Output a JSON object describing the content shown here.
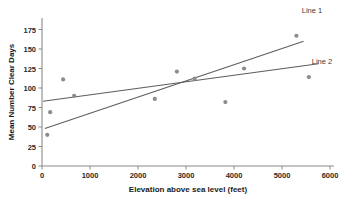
{
  "chart_data": {
    "type": "scatter",
    "title": "",
    "xlabel": "Elevation above sea level (feet)",
    "ylabel": "Mean Number Clear Days",
    "xlim": [
      0,
      6000
    ],
    "ylim": [
      0,
      190
    ],
    "xticks": [
      0,
      1000,
      2000,
      3000,
      4000,
      5000,
      6000
    ],
    "xtick_labels": [
      "0",
      "1000",
      "2000",
      "3000",
      "4000",
      "5000",
      "6000"
    ],
    "yticks": [
      0,
      25,
      50,
      75,
      100,
      125,
      150,
      175
    ],
    "ytick_labels": [
      "0",
      "25",
      "50",
      "75",
      "100",
      "125",
      "150",
      "175"
    ],
    "grid": false,
    "legend_position": "inline-right",
    "points": [
      {
        "x": 110,
        "y": 40
      },
      {
        "x": 170,
        "y": 69
      },
      {
        "x": 440,
        "y": 111
      },
      {
        "x": 670,
        "y": 90
      },
      {
        "x": 2350,
        "y": 86
      },
      {
        "x": 2810,
        "y": 121
      },
      {
        "x": 3180,
        "y": 112
      },
      {
        "x": 3820,
        "y": 82
      },
      {
        "x": 4210,
        "y": 125
      },
      {
        "x": 5300,
        "y": 167
      },
      {
        "x": 5560,
        "y": 114
      }
    ],
    "series": [
      {
        "name": "Line 1",
        "type": "trendline",
        "x": [
          60,
          5450
        ],
        "values": [
          48,
          160
        ],
        "color": "#5d5d5d"
      },
      {
        "name": "Line 2",
        "type": "trendline",
        "x": [
          20,
          5760
        ],
        "values": [
          83,
          131
        ],
        "color": "#5d5d5d"
      }
    ],
    "annotations": [
      {
        "text": "Line 1",
        "x_px": 312,
        "y_px": 11
      },
      {
        "text": "Line 2",
        "x_px": 322,
        "y_px": 62
      }
    ]
  }
}
